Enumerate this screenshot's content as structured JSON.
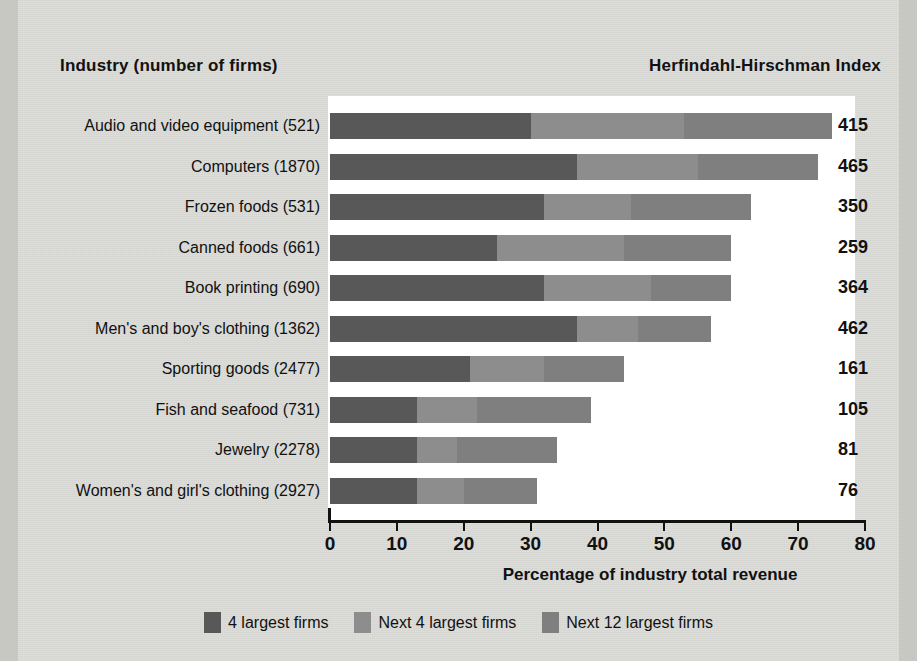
{
  "headers": {
    "left": "Industry (number of firms)",
    "right": "Herfindahl-Hirschman Index"
  },
  "axis": {
    "title": "Percentage of industry total revenue",
    "ticks": [
      "0",
      "10",
      "20",
      "30",
      "40",
      "50",
      "60",
      "70",
      "80"
    ]
  },
  "legend": [
    {
      "label": "4 largest firms",
      "color": "#585858"
    },
    {
      "label": "Next 4 largest firms",
      "color": "#8d8d8d"
    },
    {
      "label": "Next 12 largest firms",
      "color": "#7f7f7f"
    }
  ],
  "rows": [
    {
      "label": "Audio and video equipment  (521)",
      "hhi": "415"
    },
    {
      "label": "Computers  (1870)",
      "hhi": "465"
    },
    {
      "label": "Frozen foods  (531)",
      "hhi": "350"
    },
    {
      "label": "Canned foods  (661)",
      "hhi": "259"
    },
    {
      "label": "Book printing  (690)",
      "hhi": "364"
    },
    {
      "label": "Men's and boy's clothing  (1362)",
      "hhi": "462"
    },
    {
      "label": "Sporting goods  (2477)",
      "hhi": "161"
    },
    {
      "label": "Fish and seafood  (731)",
      "hhi": "105"
    },
    {
      "label": "Jewelry  (2278)",
      "hhi": "81"
    },
    {
      "label": "Women's and girl's clothing  (2927)",
      "hhi": "76"
    }
  ],
  "chart_data": {
    "type": "bar",
    "orientation": "horizontal",
    "stacked": true,
    "title": "",
    "xlabel": "Percentage of industry total revenue",
    "ylabel": "Industry (number of firms)",
    "xlim": [
      0,
      80
    ],
    "xticks": [
      0,
      10,
      20,
      30,
      40,
      50,
      60,
      70,
      80
    ],
    "grid": false,
    "legend_position": "bottom",
    "categories": [
      "Audio and video equipment  (521)",
      "Computers  (1870)",
      "Frozen foods  (531)",
      "Canned foods  (661)",
      "Book printing  (690)",
      "Men's and boy's clothing  (1362)",
      "Sporting goods  (2477)",
      "Fish and seafood  (731)",
      "Jewelry  (2278)",
      "Women's and girl's clothing  (2927)"
    ],
    "series": [
      {
        "name": "4 largest firms",
        "color": "#585858",
        "values": [
          30,
          37,
          32,
          25,
          32,
          37,
          21,
          13,
          13,
          13
        ]
      },
      {
        "name": "Next 4 largest firms",
        "color": "#8d8d8d",
        "values": [
          23,
          18,
          13,
          19,
          16,
          9,
          11,
          9,
          6,
          7
        ]
      },
      {
        "name": "Next 12 largest firms",
        "color": "#7f7f7f",
        "values": [
          22,
          18,
          18,
          16,
          12,
          11,
          12,
          17,
          15,
          11
        ]
      }
    ],
    "totals": [
      75,
      73,
      63,
      60,
      60,
      57,
      44,
      39,
      34,
      31
    ],
    "annotations": {
      "name": "Herfindahl-Hirschman Index",
      "values": [
        415,
        465,
        350,
        259,
        364,
        462,
        161,
        105,
        81,
        76
      ]
    }
  }
}
